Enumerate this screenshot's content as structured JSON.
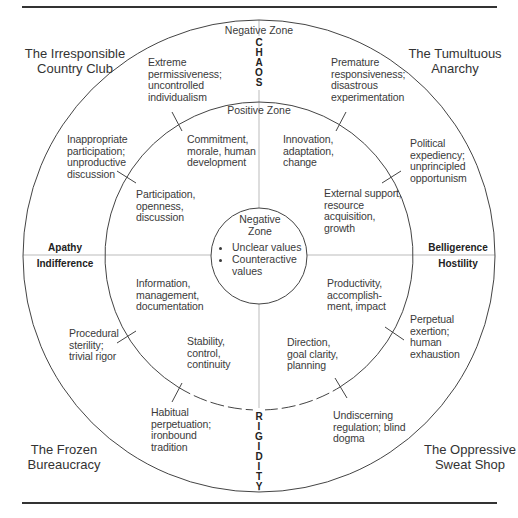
{
  "diagram": {
    "type": "concentric-circle quadrant model",
    "colors": {
      "line": "#444444",
      "axis": "#bbbbbb",
      "text": "#3a3a3a",
      "background": "#ffffff"
    },
    "geometry": {
      "center": [
        259,
        256
      ],
      "outer_radius": 236,
      "inner_radius": 154,
      "core_radius": 48
    },
    "axes": {
      "top": {
        "word": "CHAOS",
        "letters": [
          "C",
          "H",
          "A",
          "O",
          "S"
        ]
      },
      "bottom": {
        "word": "RIGIDITY",
        "letters": [
          "R",
          "I",
          "G",
          "I",
          "D",
          "I",
          "T",
          "Y"
        ]
      },
      "left": {
        "outer": "Apathy",
        "inner": "Indifference"
      },
      "right": {
        "outer": "Belligerence",
        "inner": "Hostility"
      }
    },
    "zones": {
      "outer_label": "Negative Zone",
      "inner_label": "Positive Zone",
      "core": {
        "title_line1": "Negative",
        "title_line2": "Zone",
        "bullets": [
          "Unclear values",
          "Counteractive values"
        ]
      }
    },
    "corners": {
      "top_left": {
        "line1": "The Irresponsible",
        "line2": "Country Club"
      },
      "top_right": {
        "line1": "The Tumultuous",
        "line2": "Anarchy"
      },
      "bottom_left": {
        "line1": "The Frozen",
        "line2": "Bureaucracy"
      },
      "bottom_right": {
        "line1": "The Oppressive",
        "line2": "Sweat Shop"
      }
    },
    "negative_ring": {
      "nw_top": [
        "Extreme",
        "permissiveness;",
        "uncontrolled",
        "individualism"
      ],
      "nw_side": [
        "Inappropriate",
        "participation;",
        "unproductive",
        "discussion"
      ],
      "ne_top": [
        "Premature",
        "responsiveness;",
        "disastrous",
        "experimentation"
      ],
      "ne_side": [
        "Political",
        "expediency;",
        "unprincipled",
        "opportunism"
      ],
      "sw_side": [
        "Procedural",
        "sterility;",
        "trivial rigor"
      ],
      "sw_bottom": [
        "Habitual",
        "perpetuation;",
        "ironbound",
        "tradition"
      ],
      "se_side": [
        "Perpetual",
        "exertion;",
        "human",
        "exhaustion"
      ],
      "se_bottom": [
        "Undiscerning",
        "regulation; blind",
        "dogma"
      ]
    },
    "positive_ring": {
      "nw_top": [
        "Commitment,",
        "morale, human",
        "development"
      ],
      "nw_side": [
        "Participation,",
        "openness,",
        "discussion"
      ],
      "ne_top": [
        "Innovation,",
        "adaptation,",
        "change"
      ],
      "ne_side": [
        "External support,",
        "resource",
        "acquisition,",
        "growth"
      ],
      "sw_side": [
        "Information,",
        "management,",
        "documentation"
      ],
      "sw_bottom": [
        "Stability,",
        "control,",
        "continuity"
      ],
      "se_side": [
        "Productivity,",
        "accomplish-",
        "ment, impact"
      ],
      "se_bottom": [
        "Direction,",
        "goal clarity,",
        "planning"
      ]
    }
  }
}
